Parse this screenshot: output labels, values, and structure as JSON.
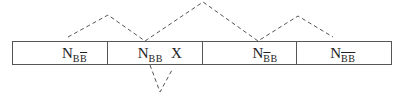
{
  "diagram": {
    "cells": [
      {
        "main": "N",
        "sub_parts": [
          {
            "text": "B",
            "overline": false
          },
          {
            "text": "B",
            "overline": true
          }
        ],
        "suffix": ""
      },
      {
        "main": "N",
        "sub_parts": [
          {
            "text": "BB",
            "overline": false
          }
        ],
        "suffix": "X"
      },
      {
        "main": "N",
        "sub_parts": [
          {
            "text": "B",
            "overline": true
          },
          {
            "text": "B",
            "overline": false
          }
        ],
        "suffix": ""
      },
      {
        "main": "N",
        "sub_parts": [
          {
            "text": "BB",
            "overline": true
          }
        ],
        "suffix": ""
      }
    ],
    "line_color": "#555555",
    "upper_path": [
      [
        68,
        37
      ],
      [
        108,
        15
      ],
      [
        145,
        41
      ],
      [
        203,
        2
      ],
      [
        258,
        41
      ],
      [
        298,
        16
      ],
      [
        333,
        37
      ]
    ],
    "lower_path": [
      [
        150,
        65
      ],
      [
        160,
        92
      ],
      [
        172,
        70
      ]
    ]
  }
}
